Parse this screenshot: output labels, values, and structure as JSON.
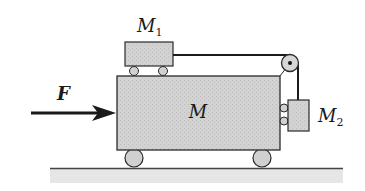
{
  "diagram": {
    "title": "",
    "labels": {
      "force": "F",
      "big_cart": "M",
      "top_block": "M",
      "top_block_sub": "1",
      "hanging_block": "M",
      "hanging_block_sub": "2"
    },
    "colors": {
      "block_fill": "#cfcfcf",
      "outline": "#2a2a2a",
      "ground_band": "#e2e2e2",
      "string": "#1a1a1a"
    },
    "elements": [
      {
        "id": "M",
        "type": "cart",
        "description": "large cart on two wheels resting on horizontal ground"
      },
      {
        "id": "M1",
        "type": "block",
        "description": "small cart on top of M on two small wheels"
      },
      {
        "id": "M2",
        "type": "block",
        "description": "hanging block against right face of M, with two small wheels touching M"
      },
      {
        "id": "pulley",
        "type": "pulley",
        "description": "pulley at top-right corner of M"
      },
      {
        "id": "string",
        "type": "string",
        "description": "connects M1 over pulley down to M2"
      },
      {
        "id": "F",
        "type": "force_arrow",
        "direction": "right",
        "description": "horizontal force applied to left face of M"
      }
    ]
  }
}
